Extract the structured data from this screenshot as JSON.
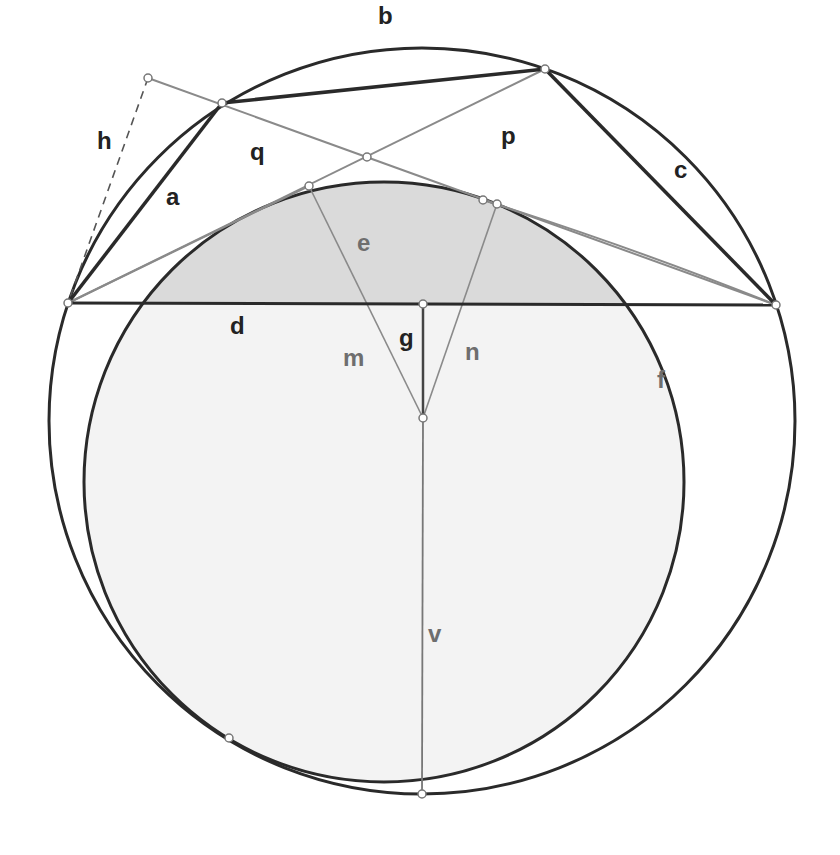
{
  "diagram": {
    "title": "",
    "colors": {
      "background": "#ffffff",
      "stroke_dark": "#2a2a2a",
      "stroke_gray": "#8a8a8a",
      "fill_shaded": "#dadada",
      "fill_light": "#f3f3f3",
      "label_dark": "#222222",
      "label_gray": "#6e6e6e",
      "point_fill": "#ffffff"
    },
    "circles": [
      {
        "id": "outer",
        "cx": 422,
        "cy": 421,
        "r": 373
      },
      {
        "id": "inner",
        "cx": 384,
        "cy": 482,
        "r": 300
      }
    ],
    "points": [
      {
        "id": "P_left",
        "x": 68,
        "y": 303
      },
      {
        "id": "P_right",
        "x": 776,
        "y": 305
      },
      {
        "id": "P_A",
        "x": 222,
        "y": 103
      },
      {
        "id": "P_B",
        "x": 545,
        "y": 69
      },
      {
        "id": "P_h",
        "x": 148,
        "y": 78
      },
      {
        "id": "P_x",
        "x": 367,
        "y": 157
      },
      {
        "id": "P_t1",
        "x": 309,
        "y": 186
      },
      {
        "id": "P_t2",
        "x": 483,
        "y": 200
      },
      {
        "id": "P_t3",
        "x": 497,
        "y": 204
      },
      {
        "id": "P_g_top",
        "x": 423,
        "y": 304
      },
      {
        "id": "P_center",
        "x": 423,
        "y": 418
      },
      {
        "id": "P_bottom",
        "x": 422,
        "y": 794
      },
      {
        "id": "P_tan",
        "x": 229,
        "y": 738
      }
    ],
    "labels": [
      {
        "text": "a",
        "x": 166,
        "y": 205,
        "tone": "dark"
      },
      {
        "text": "b",
        "x": 378,
        "y": 24,
        "tone": "dark"
      },
      {
        "text": "c",
        "x": 674,
        "y": 178,
        "tone": "dark"
      },
      {
        "text": "d",
        "x": 230,
        "y": 334,
        "tone": "dark"
      },
      {
        "text": "e",
        "x": 357,
        "y": 251,
        "tone": "gray"
      },
      {
        "text": "f",
        "x": 657,
        "y": 388,
        "tone": "gray"
      },
      {
        "text": "g",
        "x": 399,
        "y": 346,
        "tone": "dark"
      },
      {
        "text": "h",
        "x": 97,
        "y": 149,
        "tone": "dark"
      },
      {
        "text": "m",
        "x": 343,
        "y": 366,
        "tone": "gray"
      },
      {
        "text": "n",
        "x": 465,
        "y": 360,
        "tone": "gray"
      },
      {
        "text": "p",
        "x": 501,
        "y": 144,
        "tone": "dark"
      },
      {
        "text": "q",
        "x": 250,
        "y": 160,
        "tone": "dark"
      },
      {
        "text": "v",
        "x": 428,
        "y": 642,
        "tone": "gray"
      }
    ]
  }
}
